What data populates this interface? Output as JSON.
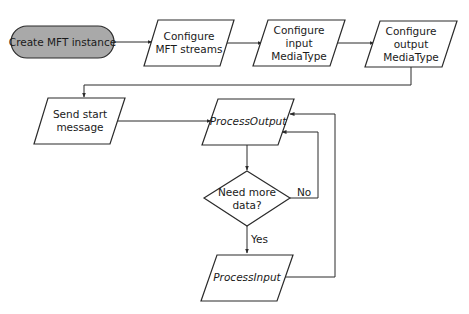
{
  "diagram": {
    "type": "flowchart",
    "nodes": {
      "create_mft": {
        "shape": "terminator",
        "lines": [
          "Create MFT instance"
        ],
        "fill": "#a9a9a9"
      },
      "config_streams": {
        "shape": "parallelogram",
        "lines": [
          "Configure",
          "MFT streams"
        ]
      },
      "config_input": {
        "shape": "parallelogram",
        "lines": [
          "Configure",
          "input",
          "MediaType"
        ]
      },
      "config_output": {
        "shape": "parallelogram",
        "lines": [
          "Configure",
          "output",
          "MediaType"
        ]
      },
      "send_start": {
        "shape": "parallelogram",
        "lines": [
          "Send start",
          "message"
        ]
      },
      "process_output": {
        "shape": "parallelogram",
        "lines": [
          "ProcessOutput"
        ],
        "italic": true
      },
      "need_more_data": {
        "shape": "diamond",
        "lines": [
          "Need more",
          "data?"
        ]
      },
      "process_input": {
        "shape": "parallelogram",
        "lines": [
          "ProcessInput"
        ],
        "italic": true
      }
    },
    "edges": [
      {
        "from": "create_mft",
        "to": "config_streams",
        "label": ""
      },
      {
        "from": "config_streams",
        "to": "config_input",
        "label": ""
      },
      {
        "from": "config_input",
        "to": "config_output",
        "label": ""
      },
      {
        "from": "config_output",
        "to": "send_start",
        "label": ""
      },
      {
        "from": "send_start",
        "to": "process_output",
        "label": ""
      },
      {
        "from": "process_output",
        "to": "need_more_data",
        "label": ""
      },
      {
        "from": "need_more_data",
        "to": "process_input",
        "label": "Yes"
      },
      {
        "from": "need_more_data",
        "to": "process_output",
        "label": "No"
      },
      {
        "from": "process_input",
        "to": "process_output",
        "label": ""
      }
    ],
    "edge_labels": {
      "yes": "Yes",
      "no": "No"
    }
  }
}
